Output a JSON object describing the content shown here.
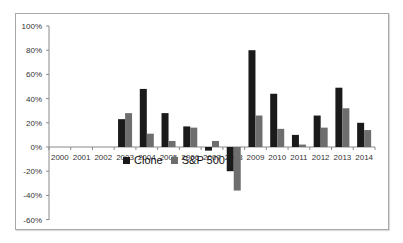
{
  "chart_data": {
    "type": "bar",
    "title": "",
    "xlabel": "",
    "ylabel": "",
    "categories": [
      "2000",
      "2001",
      "2002",
      "2003",
      "2004",
      "2005",
      "2006",
      "2007",
      "2008",
      "2009",
      "2010",
      "2011",
      "2012",
      "2013",
      "2014"
    ],
    "series": [
      {
        "name": "Clone",
        "color": "#1a1a1a",
        "values": [
          0,
          0,
          0,
          23,
          48,
          28,
          17,
          -3,
          -20,
          80,
          44,
          10,
          26,
          49,
          20
        ]
      },
      {
        "name": "S&P 500",
        "color": "#6e6e6e",
        "values": [
          0,
          0,
          0,
          28,
          11,
          5,
          16,
          5,
          -36,
          26,
          15,
          2,
          16,
          32,
          14
        ]
      }
    ],
    "yticks": [
      "100%",
      "80%",
      "60%",
      "40%",
      "20%",
      "0%",
      "-20%",
      "-40%",
      "-60%"
    ],
    "ylim": [
      -60,
      100
    ],
    "grid": false,
    "legend_position": "inside-bottom-center"
  },
  "legend": {
    "clone": "Clone",
    "sp500": "S&P 500"
  }
}
